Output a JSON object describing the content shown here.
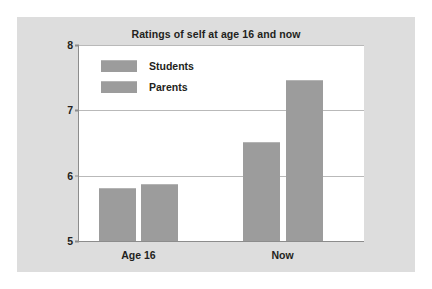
{
  "chart_data": {
    "type": "bar",
    "title": "Ratings of self at age 16 and now",
    "xlabel": "",
    "ylabel": "",
    "categories": [
      "Age 16",
      "Now"
    ],
    "series": [
      {
        "name": "Students",
        "values": [
          5.8,
          6.5
        ],
        "color": "#9c9c9c"
      },
      {
        "name": "Parents",
        "values": [
          5.85,
          7.45
        ],
        "color": "#9c9c9c"
      }
    ],
    "ylim": [
      5,
      8
    ],
    "yticks": [
      5,
      6,
      7,
      8
    ],
    "ytick_labels": [
      "5",
      "6",
      "7",
      "8"
    ],
    "grid": true,
    "legend_position": "top-left-inside"
  },
  "labels": {
    "ytick_8": "8",
    "ytick_7": "7",
    "ytick_6": "6",
    "ytick_5": "5",
    "xtick_0": "Age 16",
    "xtick_1": "Now",
    "legend_0": "Students",
    "legend_1": "Parents"
  },
  "colors": {
    "bar": "#9c9c9c",
    "figure_background": "#dddddd",
    "plot_background": "#ffffff",
    "grid": "#b9b9b9",
    "axis": "#8c8c8c",
    "text": "#231f20"
  }
}
